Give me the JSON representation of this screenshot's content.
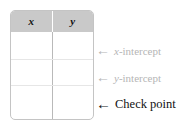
{
  "figure": {
    "name": "xy-table-with-intercept-annotations",
    "background_color": "#ffffff"
  },
  "table": {
    "columns": [
      {
        "label": "x",
        "style": "italic"
      },
      {
        "label": "y",
        "style": "italic"
      }
    ],
    "header_background": "#c9c9c9",
    "border_color": "#c4c4c4",
    "row_separator_color": "#e6e6e6",
    "rows": [
      {
        "x": "",
        "y": ""
      },
      {
        "x": "",
        "y": ""
      },
      {
        "x": "",
        "y": ""
      }
    ]
  },
  "annotations": [
    {
      "id": "x-intercept",
      "arrow": "←",
      "text_prefix": "x",
      "text_suffix": "-intercept",
      "color": "#b5b5b5",
      "emphasis": "muted"
    },
    {
      "id": "y-intercept",
      "arrow": "←",
      "text_prefix": "y",
      "text_suffix": "-intercept",
      "color": "#b5b5b5",
      "emphasis": "muted"
    },
    {
      "id": "check-point",
      "arrow": "←",
      "text_prefix": "",
      "text_suffix": "Check point",
      "color": "#111111",
      "emphasis": "strong"
    }
  ]
}
